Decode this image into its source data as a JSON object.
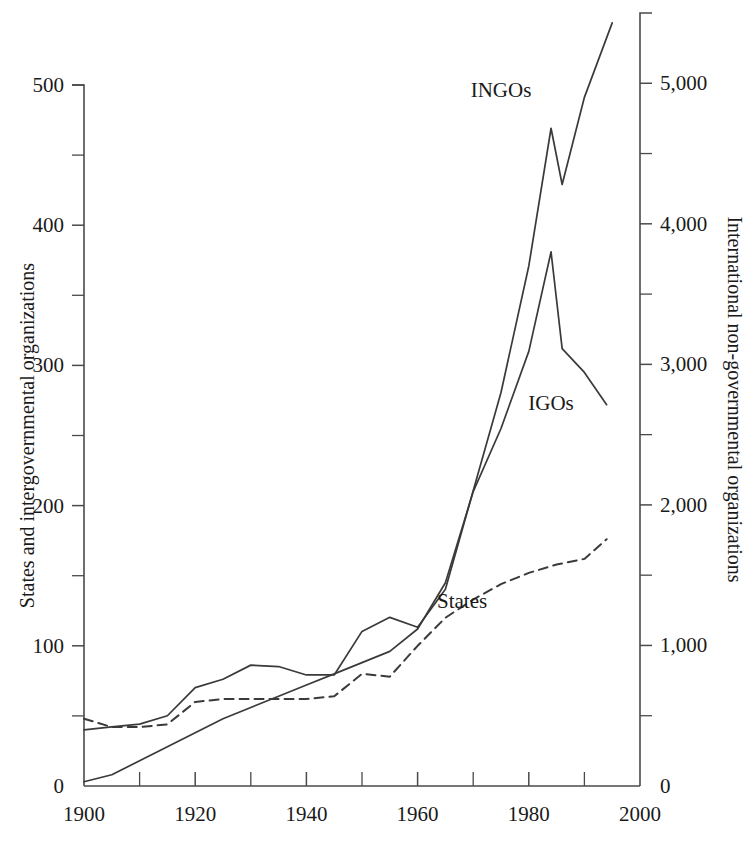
{
  "chart_data": {
    "type": "line",
    "title": "",
    "subtitle": "",
    "xlabel": "",
    "ylabel": "States and intergovernmental organizations",
    "y2label": "International non-governmental organizations",
    "xlim": [
      1900,
      2000
    ],
    "ylim": [
      0,
      500
    ],
    "y2lim": [
      0,
      5500
    ],
    "grid": false,
    "legend_position": "inline-annotations",
    "x_ticks_major": [
      1900,
      1920,
      1940,
      1960,
      1980,
      2000
    ],
    "x_ticks_minor": [
      1910,
      1930,
      1950,
      1970,
      1990
    ],
    "x_tick_labels": [
      "1900",
      "1920",
      "1940",
      "1960",
      "1980",
      "2000"
    ],
    "y_ticks_major": [
      0,
      100,
      200,
      300,
      400,
      500
    ],
    "y_tick_labels": [
      "0",
      "100",
      "200",
      "300",
      "400",
      "500"
    ],
    "y_ticks_minor": [
      50,
      150,
      250,
      350,
      450
    ],
    "y2_ticks_major": [
      0,
      1000,
      2000,
      3000,
      4000,
      5000
    ],
    "y2_tick_labels": [
      "0",
      "1,000",
      "2,000",
      "3,000",
      "4,000",
      "5,000"
    ],
    "y2_ticks_minor": [
      500,
      1500,
      2500,
      3500,
      4500
    ],
    "series": [
      {
        "name": "INGOs",
        "label": "INGOs",
        "axis": "right",
        "style": "solid",
        "annotation_x": 1975,
        "annotation_y": 4900,
        "x": [
          1900,
          1905,
          1910,
          1915,
          1920,
          1925,
          1930,
          1935,
          1940,
          1945,
          1950,
          1955,
          1960,
          1965,
          1970,
          1975,
          1980,
          1984,
          1986,
          1990,
          1995
        ],
        "values": [
          400,
          420,
          440,
          500,
          700,
          760,
          860,
          850,
          790,
          790,
          1100,
          1200,
          1130,
          1400,
          2100,
          2800,
          3700,
          4680,
          4280,
          4900,
          5430
        ]
      },
      {
        "name": "IGOs",
        "label": "IGOs",
        "axis": "left",
        "style": "solid",
        "annotation_x": 1984,
        "annotation_y": 268,
        "x": [
          1900,
          1905,
          1910,
          1915,
          1920,
          1925,
          1930,
          1935,
          1940,
          1945,
          1950,
          1955,
          1960,
          1965,
          1970,
          1975,
          1980,
          1984,
          1986,
          1990,
          1994
        ],
        "values": [
          3,
          8,
          18,
          28,
          38,
          48,
          56,
          64,
          72,
          80,
          88,
          96,
          112,
          145,
          210,
          255,
          310,
          381,
          312,
          295,
          272
        ]
      },
      {
        "name": "States",
        "label": "States",
        "axis": "left",
        "style": "dashed",
        "annotation_x": 1968,
        "annotation_y": 127,
        "x": [
          1900,
          1905,
          1910,
          1915,
          1920,
          1925,
          1930,
          1935,
          1940,
          1945,
          1950,
          1955,
          1960,
          1965,
          1970,
          1975,
          1980,
          1985,
          1990,
          1994
        ],
        "values": [
          48,
          42,
          42,
          44,
          60,
          62,
          62,
          62,
          62,
          64,
          80,
          78,
          100,
          120,
          133,
          144,
          152,
          158,
          162,
          176
        ]
      }
    ],
    "annotations": [
      {
        "text": "INGOs",
        "x": 1975,
        "y": 4900
      },
      {
        "text": "IGOs",
        "x": 1984,
        "y": 268
      },
      {
        "text": "States",
        "x": 1968,
        "y": 127
      }
    ],
    "colors": {
      "line": "#3a3a3a",
      "axis": "#4a4a4a",
      "text": "#1a1a1a",
      "background": "#ffffff"
    }
  }
}
